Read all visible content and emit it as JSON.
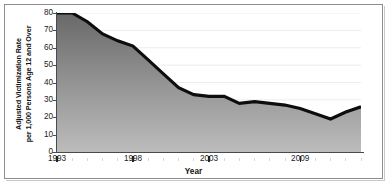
{
  "chart_data": {
    "type": "area",
    "title": "",
    "xlabel": "Year",
    "ylabel_line1": "Adjusted Victimization Rate",
    "ylabel_line2": "per 1,000 Persons Age 12 and Over",
    "xlim": [
      1993,
      2013
    ],
    "ylim": [
      0,
      80
    ],
    "grid": true,
    "legend": "none",
    "y_ticks": [
      80,
      70,
      60,
      50,
      40,
      30,
      20,
      10,
      0
    ],
    "x_ticks_major": [
      1993,
      1998,
      2003,
      2009
    ],
    "x_tick_labels": [
      "1993",
      "1998",
      "2003",
      "2009"
    ],
    "x_minor_step": 1,
    "x": [
      1993,
      1994,
      1995,
      1996,
      1997,
      1998,
      1999,
      2000,
      2001,
      2002,
      2003,
      2004,
      2005,
      2006,
      2007,
      2008,
      2009,
      2010,
      2011,
      2012,
      2013
    ],
    "values": [
      80,
      80,
      75,
      68,
      64,
      61,
      53,
      45,
      37,
      33,
      32,
      32,
      28,
      29,
      28,
      27,
      25,
      22,
      19,
      23,
      26
    ],
    "series": [
      {
        "name": "Adjusted victimization rate",
        "values": [
          80,
          80,
          75,
          68,
          64,
          61,
          53,
          45,
          37,
          33,
          32,
          32,
          28,
          29,
          28,
          27,
          25,
          22,
          19,
          23,
          26
        ]
      }
    ],
    "line_color": "#0d0d0d",
    "fill_color_top": "#6e6e6e",
    "fill_color_bottom": "#b4b4b4",
    "axis_color": "#4a4a4a",
    "grid_color": "#ececec",
    "frame_color": "#8d8d8d"
  }
}
